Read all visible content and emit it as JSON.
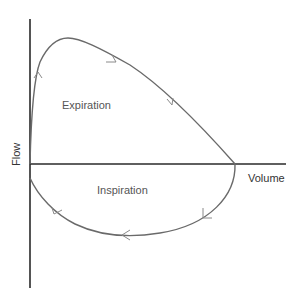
{
  "diagram": {
    "axes": {
      "y_label": "Flow",
      "x_label": "Volume"
    },
    "regions": {
      "upper_label": "Expiration",
      "lower_label": "Inspiration"
    },
    "direction": "clockwise",
    "colors": {
      "axis": "#2a2a2a",
      "curve": "#6a6a6a",
      "arrow": "#8a8a8a",
      "text": "#555555"
    }
  }
}
